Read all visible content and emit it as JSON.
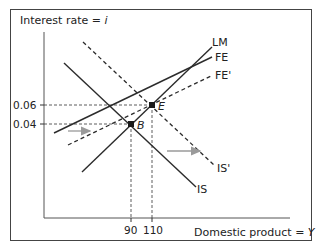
{
  "diagram": {
    "y_axis_label": "Interest rate = ",
    "y_axis_var": "i",
    "x_axis_label": "Domestic product = ",
    "x_axis_var": "Y",
    "y_ticks": [
      "0.06",
      "0.04"
    ],
    "x_ticks": [
      "90",
      "110"
    ],
    "curves": {
      "LM": "LM",
      "FE": "FE",
      "FE_prime": "FE'",
      "IS": "IS",
      "IS_prime": "IS'"
    },
    "points": {
      "B": "B",
      "E": "E"
    },
    "colors": {
      "line": "#2b2b2b",
      "arrow": "#9a9a9a",
      "frame": "#444444"
    }
  }
}
